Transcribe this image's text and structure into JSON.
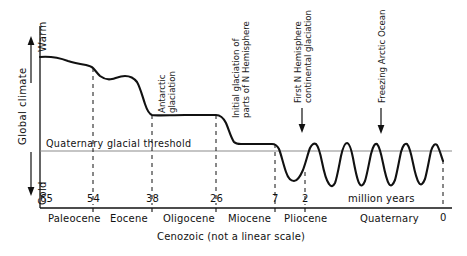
{
  "figure": {
    "title_axis_y": "Global climate",
    "y_top_label": "Warm",
    "y_bottom_label": "Cold",
    "x_unit_label": "million years",
    "x_axis_caption": "Cenozoic (not a linear scale)",
    "threshold_label": "Quaternary glacial threshold",
    "ink_color": "#111111",
    "threshold_color": "#8c8c8c",
    "background": "#ffffff"
  },
  "chart_data": {
    "type": "line",
    "title": "",
    "xlabel": "million years",
    "ylabel": "Global climate",
    "xlim": [
      65,
      0
    ],
    "note": "x axis is not a linear scale; y axis is qualitative warm-to-cold",
    "grid": false,
    "legend": "none",
    "tick_values": [
      65,
      54,
      38,
      26,
      7,
      2,
      0
    ],
    "tick_labels": [
      "65",
      "54",
      "38",
      "26",
      "7",
      "2",
      "0"
    ],
    "epochs": [
      {
        "name": "Paleocene",
        "from": 65,
        "to": 54
      },
      {
        "name": "Eocene",
        "from": 54,
        "to": 38
      },
      {
        "name": "Oligocene",
        "from": 38,
        "to": 26
      },
      {
        "name": "Miocene",
        "from": 26,
        "to": 7
      },
      {
        "name": "Pliocene",
        "from": 7,
        "to": 2
      },
      {
        "name": "Quaternary",
        "from": 2,
        "to": 0
      }
    ],
    "threshold": {
      "label": "Quaternary glacial threshold",
      "y_pixel": 151
    },
    "annotations": [
      {
        "text": "Antarctic glaciation",
        "lines": [
          "Antarctic",
          "glaciation"
        ],
        "rotated": true,
        "arrow": false
      },
      {
        "text": "Initial glaciation of parts of N Hemisphere",
        "lines": [
          "Initial glaciation of",
          "parts of N Hemisphere"
        ],
        "rotated": true,
        "arrow": false
      },
      {
        "text": "First N Hemisphere continental glaciation",
        "lines": [
          "First N Hemisphere",
          "continental glaciation"
        ],
        "rotated": true,
        "arrow": true
      },
      {
        "text": "Freezing Arctic Ocean",
        "lines": [
          "Freezing Arctic Ocean"
        ],
        "rotated": true,
        "arrow": true
      }
    ],
    "curve_description": "Warm plateau in Paleocene, stepwise cooling through Eocene and Oligocene, further drop in late Miocene, then high-amplitude glacial-interglacial oscillations through the Quaternary crossing the glacial threshold.",
    "curve_points_px": "M40,57 C52,56 60,58 68,61 C74,63 80,64 86,65 C90,66 92,67 93,68 C95,70 97,73 100,76 C104,79 108,80 112,79 C116,78 120,76 125,76 C130,76 134,78 137,82 C140,87 142,95 145,104 C147,110 149,114 152,115 C158,116 170,115 185,115 C197,115 208,115 216,115 C220,115 223,117 226,123 C229,130 231,138 234,142 C236,144 238,144 241,144 C250,144 262,144 272,144 C275,144 277,145 279,149 C281,154 283,163 286,172 C288,178 291,181 294,181 C297,181 300,177 303,170 C306,162 308,153 310,148 C312,144 314,143 316,144 C318,146 320,152 322,162 C324,172 326,180 329,184 C331,187 333,187 335,183 C337,178 339,166 341,156 C343,147 345,143 347,143 C349,143 351,148 353,158 C355,169 357,179 359,183 C361,187 363,186 365,181 C367,175 369,163 371,154 C373,146 375,143 377,144 C379,146 381,153 383,163 C385,173 387,181 389,184 C391,187 393,185 395,180 C397,173 399,161 401,152 C403,145 405,143 407,144 C409,146 411,153 413,163 C415,173 417,180 419,183 C421,186 423,184 425,179 C427,172 429,160 431,151 C433,145 435,143 437,145 C439,148 441,155 443,161"
  },
  "elements": {
    "arrow_up_name": "warm-arrow-icon",
    "arrow_down_name": "cold-arrow-icon"
  }
}
